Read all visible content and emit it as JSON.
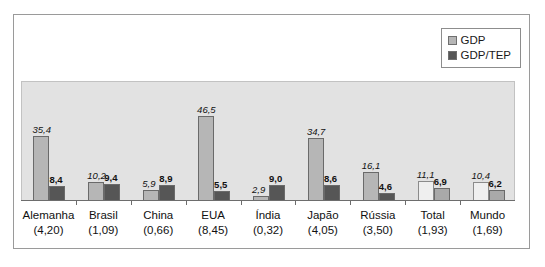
{
  "chart_data": {
    "type": "bar",
    "title": "",
    "subtitle": "",
    "xlabel": "",
    "ylabel": "",
    "grid": false,
    "legend_position": "top-right",
    "ylim": [
      0,
      48
    ],
    "categories": [
      "Alemanha",
      "Brasil",
      "China",
      "EUA",
      "Índia",
      "Japão",
      "Rússia",
      "Total",
      "Mundo"
    ],
    "category_sublabels": [
      "(4,20)",
      "(1,09)",
      "(0,66)",
      "(8,45)",
      "(0,32)",
      "(4,05)",
      "(3,50)",
      "(1,93)",
      "(1,69)"
    ],
    "series": [
      {
        "name": "GDP",
        "color": "#b6b6b6",
        "values": [
          35.4,
          10.2,
          5.9,
          46.5,
          2.9,
          34.7,
          16.1,
          11.1,
          10.4
        ],
        "value_labels": [
          "35,4",
          "10,2",
          "5,9",
          "46,5",
          "2,9",
          "34,7",
          "16,1",
          "11,1",
          "10,4"
        ]
      },
      {
        "name": "GDP/TEP",
        "color": "#565656",
        "values": [
          8.4,
          9.4,
          8.9,
          5.5,
          9.0,
          8.6,
          4.6,
          6.9,
          6.2
        ],
        "value_labels": [
          "8,4",
          "9,4",
          "8,9",
          "5,5",
          "9,0",
          "8,6",
          "4,6",
          "6,9",
          "6,2"
        ]
      }
    ]
  },
  "legend": {
    "items": [
      {
        "label": "GDP",
        "swatch": "#b6b6b6"
      },
      {
        "label": "GDP/TEP",
        "swatch": "#565656"
      }
    ]
  },
  "colors": {
    "plot_background": "#e2e2e2",
    "figure_background": "#ffffff",
    "frame": "#9a9a9a",
    "axis": "#6d6d6d",
    "gdp": "#b6b6b6",
    "gdp_tep": "#565656"
  }
}
